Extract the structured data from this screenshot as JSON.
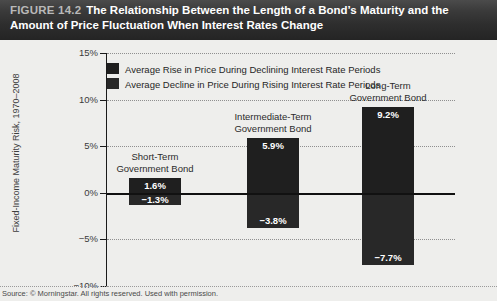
{
  "header": {
    "figure_number": "FIGURE 14.2",
    "title_line1": "The Relationship Between the Length of a Bond’s Maturity and the",
    "title_line2": "Amount of Price Fluctuation When Interest Rates Change"
  },
  "source": {
    "text": "Source: © Morningstar. All rights reserved. Used with permission."
  },
  "chart_data": {
    "type": "bar",
    "title": "The Relationship Between the Length of a Bond’s Maturity and the Amount of Price Fluctuation When Interest Rates Change",
    "xlabel": "",
    "ylabel": "Fixed-Income Maturity Risk, 1970–2008",
    "ylim": [
      -10,
      15
    ],
    "ytick_values": [
      15,
      10,
      5,
      0,
      -5,
      -10
    ],
    "ytick_labels": [
      "15%",
      "10%",
      "5%",
      "0%",
      "−5%",
      "−10%"
    ],
    "grid": true,
    "legend_position": "top-left",
    "categories": [
      "Short-Term Government Bond",
      "Intermediate-Term Government Bond",
      "Long-Term Government Bond"
    ],
    "category_labels": [
      {
        "line1": "Short-Term",
        "line2": "Government Bond"
      },
      {
        "line1": "Intermediate-Term",
        "line2": "Government Bond"
      },
      {
        "line1": "Long-Term",
        "line2": "Government Bond"
      }
    ],
    "series": [
      {
        "name": "Average Rise in Price During Declining Interest Rate Periods",
        "color": "#1f1f1f",
        "values": [
          1.6,
          5.9,
          9.2
        ],
        "labels": [
          "1.6%",
          "5.9%",
          "9.2%"
        ]
      },
      {
        "name": "Average Decline in Price During Rising Interest Rate Periods",
        "color": "#282828",
        "values": [
          -1.3,
          -3.8,
          -7.7
        ],
        "labels": [
          "−1.3%",
          "−3.8%",
          "−7.7%"
        ]
      }
    ]
  }
}
